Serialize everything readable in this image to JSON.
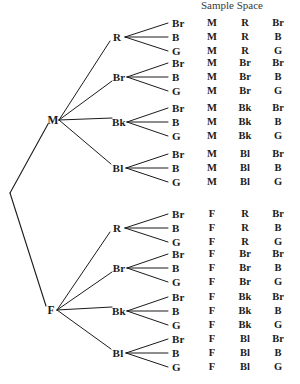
{
  "figure": {
    "title": "Sample Space",
    "title_x": 232,
    "title_y": -1,
    "ink_color": "#1b1b1b",
    "background": "#ffffff"
  },
  "root": {
    "x": 10,
    "y": 193
  },
  "level1": [
    {
      "label": "M",
      "x": 53,
      "y": 120
    },
    {
      "label": "F",
      "x": 51,
      "y": 310
    }
  ],
  "level2": [
    {
      "label": "R",
      "x": 117,
      "y": 37,
      "parent": 0
    },
    {
      "label": "Br",
      "x": 119,
      "y": 77,
      "parent": 0
    },
    {
      "label": "Bk",
      "x": 119,
      "y": 122,
      "parent": 0
    },
    {
      "label": "Bl",
      "x": 118,
      "y": 168,
      "parent": 0
    },
    {
      "label": "R",
      "x": 117,
      "y": 228,
      "parent": 1
    },
    {
      "label": "Br",
      "x": 119,
      "y": 268,
      "parent": 1
    },
    {
      "label": "Bk",
      "x": 119,
      "y": 311,
      "parent": 1
    },
    {
      "label": "Bl",
      "x": 118,
      "y": 353,
      "parent": 1
    }
  ],
  "leaf_labels": [
    "Br",
    "B",
    "G"
  ],
  "columns": {
    "leaf_x": 172,
    "col1_x": 212,
    "col2_x": 245,
    "col3_x": 278
  },
  "geometry": {
    "fan_apex_dx": 6,
    "leaf_tip_x": 168,
    "row_gap": 14,
    "group_first_row_offset": -14
  },
  "sample_space": [
    {
      "row": 1,
      "leaf": "Br",
      "c1": "M",
      "c2": "R",
      "c3": "Br",
      "y": 23
    },
    {
      "row": 2,
      "leaf": "B",
      "c1": "M",
      "c2": "R",
      "c3": "B",
      "y": 37
    },
    {
      "row": 3,
      "leaf": "G",
      "c1": "M",
      "c2": "R",
      "c3": "G",
      "y": 51
    },
    {
      "row": 4,
      "leaf": "Br",
      "c1": "M",
      "c2": "Br",
      "c3": "Br",
      "y": 63
    },
    {
      "row": 5,
      "leaf": "B",
      "c1": "M",
      "c2": "Br",
      "c3": "B",
      "y": 77
    },
    {
      "row": 6,
      "leaf": "G",
      "c1": "M",
      "c2": "Br",
      "c3": "G",
      "y": 91
    },
    {
      "row": 7,
      "leaf": "Br",
      "c1": "M",
      "c2": "Bk",
      "c3": "Br",
      "y": 108
    },
    {
      "row": 8,
      "leaf": "B",
      "c1": "M",
      "c2": "Bk",
      "c3": "B",
      "y": 122
    },
    {
      "row": 9,
      "leaf": "G",
      "c1": "M",
      "c2": "Bk",
      "c3": "G",
      "y": 136
    },
    {
      "row": 10,
      "leaf": "Br",
      "c1": "M",
      "c2": "Bl",
      "c3": "Br",
      "y": 154
    },
    {
      "row": 11,
      "leaf": "B",
      "c1": "M",
      "c2": "Bl",
      "c3": "B",
      "y": 168
    },
    {
      "row": 12,
      "leaf": "G",
      "c1": "M",
      "c2": "Bl",
      "c3": "G",
      "y": 182
    },
    {
      "row": 13,
      "leaf": "Br",
      "c1": "F",
      "c2": "R",
      "c3": "Br",
      "y": 214
    },
    {
      "row": 14,
      "leaf": "B",
      "c1": "F",
      "c2": "R",
      "c3": "B",
      "y": 228
    },
    {
      "row": 15,
      "leaf": "G",
      "c1": "F",
      "c2": "R",
      "c3": "G",
      "y": 242
    },
    {
      "row": 16,
      "leaf": "Br",
      "c1": "F",
      "c2": "Br",
      "c3": "Br",
      "y": 254
    },
    {
      "row": 17,
      "leaf": "B",
      "c1": "F",
      "c2": "Br",
      "c3": "B",
      "y": 268
    },
    {
      "row": 18,
      "leaf": "G",
      "c1": "F",
      "c2": "Br",
      "c3": "G",
      "y": 282
    },
    {
      "row": 19,
      "leaf": "Br",
      "c1": "F",
      "c2": "Bk",
      "c3": "Br",
      "y": 297
    },
    {
      "row": 20,
      "leaf": "B",
      "c1": "F",
      "c2": "Bk",
      "c3": "B",
      "y": 311
    },
    {
      "row": 21,
      "leaf": "G",
      "c1": "F",
      "c2": "Bk",
      "c3": "G",
      "y": 325
    },
    {
      "row": 22,
      "leaf": "Br",
      "c1": "F",
      "c2": "Bl",
      "c3": "Br",
      "y": 339
    },
    {
      "row": 23,
      "leaf": "B",
      "c1": "F",
      "c2": "Bl",
      "c3": "B",
      "y": 353
    },
    {
      "row": 24,
      "leaf": "G",
      "c1": "F",
      "c2": "Bl",
      "c3": "G",
      "y": 367
    }
  ]
}
